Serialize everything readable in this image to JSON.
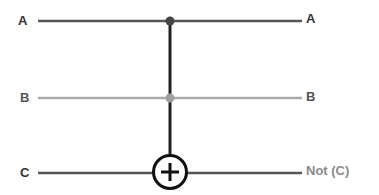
{
  "diagram": {
    "type": "quantum-logic-gate",
    "gate_name": "Toffoli (CCNOT)",
    "wires": [
      {
        "id": "A",
        "input_label": "A",
        "output_label": "A",
        "color": "#555555",
        "role": "control"
      },
      {
        "id": "B",
        "input_label": "B",
        "output_label": "B",
        "color": "#aaaaaa",
        "role": "control"
      },
      {
        "id": "C",
        "input_label": "C",
        "output_label": "Not (C)",
        "color": "#555555",
        "role": "target"
      }
    ],
    "target_symbol": "⊕",
    "colors": {
      "dark_label": "#333333",
      "light_label": "#8a8a8a",
      "control_line": "#222222",
      "control_dot_A": "#444444",
      "control_dot_B": "#a0a0a0"
    }
  }
}
